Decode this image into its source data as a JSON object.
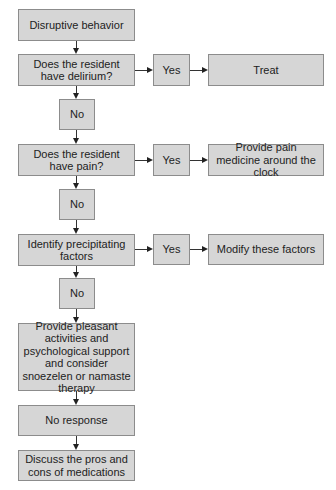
{
  "flowchart": {
    "start": {
      "label": "Disruptive behavior"
    },
    "step1": {
      "question": "Does the resident have delirium?",
      "yes_label": "Yes",
      "yes_action": "Treat",
      "no_label": "No"
    },
    "step2": {
      "question": "Does the resident have pain?",
      "yes_label": "Yes",
      "yes_action": "Provide pain medicine around the clock",
      "no_label": "No"
    },
    "step3": {
      "question": "Identify precipitating factors",
      "yes_label": "Yes",
      "yes_action": "Modify these factors",
      "no_label": "No"
    },
    "step4": {
      "label": "Provide pleasant activities and psychological support and consider snoezelen or namaste therapy"
    },
    "step5": {
      "label": "No response"
    },
    "step6": {
      "label": "Discuss the pros and cons of medications"
    }
  },
  "colors": {
    "box_fill": "#d6d6d6",
    "box_border": "#8c8c8c",
    "text": "#222222",
    "connector": "#333333"
  }
}
